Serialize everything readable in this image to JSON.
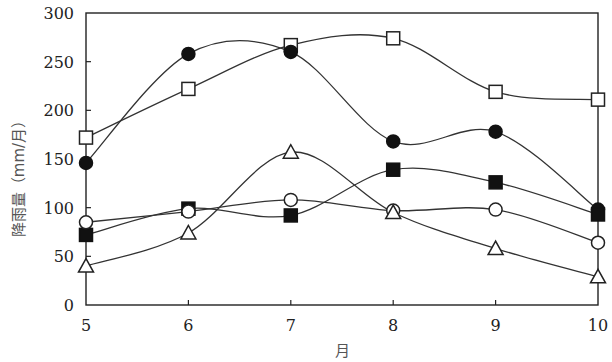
{
  "chart_data": {
    "type": "line",
    "title": "",
    "xlabel": "月",
    "ylabel": "降雨量（mm/月）",
    "x": [
      5,
      6,
      7,
      8,
      9,
      10
    ],
    "xlim": [
      5,
      10
    ],
    "ylim": [
      0,
      300
    ],
    "yticks": [
      0,
      50,
      100,
      150,
      200,
      250,
      300
    ],
    "xticks": [
      5,
      6,
      7,
      8,
      9,
      10
    ],
    "grid": false,
    "legend": null,
    "smooth": true,
    "series": [
      {
        "name": "open-square",
        "marker": "square-open",
        "values": [
          172,
          222,
          267,
          274,
          219,
          211
        ]
      },
      {
        "name": "filled-circle",
        "marker": "circle-filled",
        "values": [
          146,
          258,
          260,
          168,
          178,
          98
        ]
      },
      {
        "name": "filled-square",
        "marker": "square-filled",
        "values": [
          72,
          99,
          92,
          139,
          126,
          93
        ]
      },
      {
        "name": "open-circle",
        "marker": "circle-open",
        "values": [
          85,
          96,
          108,
          97,
          98,
          64
        ]
      },
      {
        "name": "open-triangle",
        "marker": "triangle-open",
        "values": [
          40,
          74,
          157,
          95,
          58,
          29
        ]
      }
    ]
  },
  "colors": {
    "line": "#333333",
    "marker_fill": "#111111",
    "frame": "#222222"
  }
}
